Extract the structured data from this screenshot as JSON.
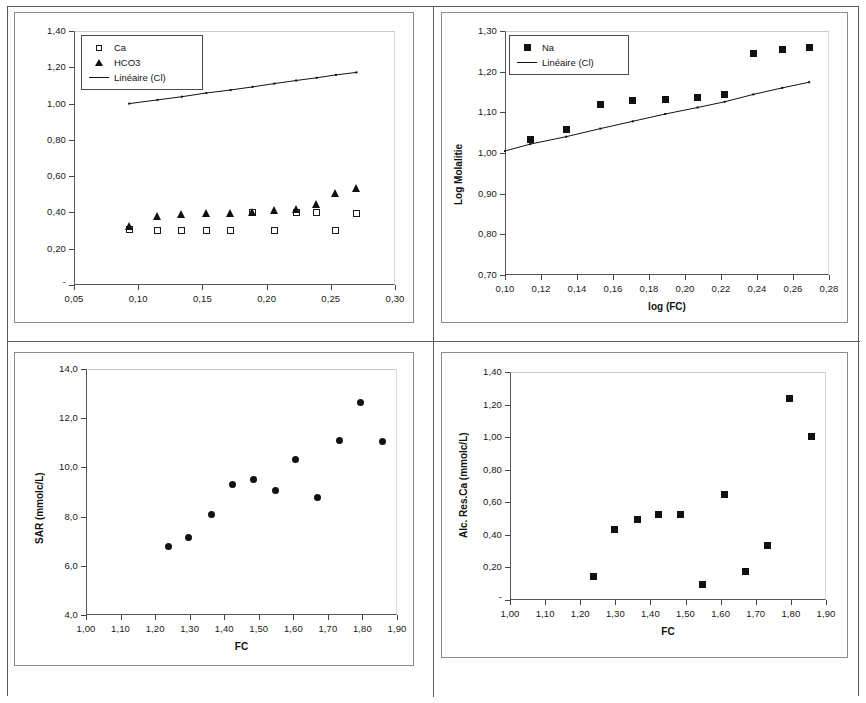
{
  "document": {
    "kind": "scanned-figure-page",
    "panel_count": 4
  },
  "charts": [
    {
      "id": "chart-1",
      "legend": [
        {
          "key": "square-open",
          "label": "Ca"
        },
        {
          "key": "triangle-filled",
          "label": "HCO3"
        },
        {
          "key": "line",
          "label": "Linéaire (Cl)"
        }
      ],
      "xticks": [
        "0,05",
        "0,10",
        "0,15",
        "0,20",
        "0,25",
        "0,30"
      ],
      "yticks": [
        "0,20",
        "0,40",
        "0,60",
        "0,80",
        "1,00",
        "1,20",
        "1,40"
      ],
      "xlabel": "",
      "ylabel": ""
    },
    {
      "id": "chart-2",
      "legend": [
        {
          "key": "square-filled",
          "label": "Na"
        },
        {
          "key": "line",
          "label": "Linéaire (Cl)"
        }
      ],
      "xticks": [
        "0,10",
        "0,12",
        "0,14",
        "0,16",
        "0,18",
        "0,20",
        "0,22",
        "0,24",
        "0,26",
        "0,28"
      ],
      "yticks": [
        "0,70",
        "0,80",
        "0,90",
        "1,00",
        "1,10",
        "1,20",
        "1,30"
      ],
      "xlabel": "log (FC)",
      "ylabel": "Log Molalitie"
    },
    {
      "id": "chart-3",
      "legend": [],
      "xticks": [
        "1,00",
        "1,10",
        "1,20",
        "1,30",
        "1,40",
        "1,50",
        "1,60",
        "1,70",
        "1,80",
        "1,90"
      ],
      "yticks": [
        "4,0",
        "6,0",
        "8,0",
        "10,0",
        "12,0",
        "14,0"
      ],
      "xlabel": "FC",
      "ylabel": "SAR (mmolc/L)"
    },
    {
      "id": "chart-4",
      "legend": [],
      "xticks": [
        "1,00",
        "1,10",
        "1,20",
        "1,30",
        "1,40",
        "1,50",
        "1,60",
        "1,70",
        "1,80",
        "1,90"
      ],
      "yticks": [
        "0,20",
        "0,40",
        "0,60",
        "0,80",
        "1,00",
        "1,20",
        "1,40"
      ],
      "xlabel": "FC",
      "ylabel": "Alc. Res.Ca (mmolc/L)"
    }
  ],
  "chart_data": [
    {
      "type": "scatter",
      "title": "",
      "xlabel": "",
      "ylabel": "",
      "xlim": [
        0.05,
        0.3
      ],
      "ylim": [
        0.0,
        1.4
      ],
      "xticks": [
        0.05,
        0.1,
        0.15,
        0.2,
        0.25,
        0.3
      ],
      "yticks": [
        0.2,
        0.4,
        0.6,
        0.8,
        1.0,
        1.2,
        1.4
      ],
      "grid": false,
      "legend_position": "top-left",
      "series": [
        {
          "name": "Ca",
          "marker": "square-open",
          "x": [
            0.093,
            0.115,
            0.134,
            0.153,
            0.172,
            0.189,
            0.206,
            0.223,
            0.239,
            0.254,
            0.27
          ],
          "y": [
            0.305,
            0.3,
            0.3,
            0.3,
            0.3,
            0.398,
            0.298,
            0.4,
            0.398,
            0.298,
            0.395
          ]
        },
        {
          "name": "HCO3",
          "marker": "triangle-filled",
          "x": [
            0.093,
            0.115,
            0.134,
            0.153,
            0.172,
            0.189,
            0.206,
            0.223,
            0.239,
            0.254,
            0.27
          ],
          "y": [
            0.325,
            0.378,
            0.39,
            0.398,
            0.395,
            0.4,
            0.415,
            0.42,
            0.447,
            0.505,
            0.537
          ]
        },
        {
          "name": "Linéaire (Cl)",
          "marker": "line",
          "x": [
            0.093,
            0.115,
            0.134,
            0.153,
            0.172,
            0.189,
            0.206,
            0.223,
            0.239,
            0.254,
            0.27
          ],
          "y": [
            1.0,
            1.02,
            1.038,
            1.058,
            1.075,
            1.092,
            1.11,
            1.127,
            1.142,
            1.158,
            1.172
          ]
        }
      ]
    },
    {
      "type": "scatter",
      "title": "",
      "xlabel": "log (FC)",
      "ylabel": "Log Molalitie",
      "xlim": [
        0.1,
        0.28
      ],
      "ylim": [
        0.7,
        1.3
      ],
      "xticks": [
        0.1,
        0.12,
        0.14,
        0.16,
        0.18,
        0.2,
        0.22,
        0.24,
        0.26,
        0.28
      ],
      "yticks": [
        0.7,
        0.8,
        0.9,
        1.0,
        1.1,
        1.2,
        1.3
      ],
      "grid": false,
      "legend_position": "top-left",
      "series": [
        {
          "name": "Na",
          "marker": "square-filled",
          "x": [
            0.114,
            0.134,
            0.153,
            0.171,
            0.189,
            0.207,
            0.222,
            0.238,
            0.254,
            0.269
          ],
          "y": [
            1.033,
            1.058,
            1.12,
            1.128,
            1.132,
            1.136,
            1.144,
            1.244,
            1.254,
            1.26
          ]
        },
        {
          "name": "Linéaire (Cl)",
          "marker": "line",
          "x": [
            0.1,
            0.114,
            0.134,
            0.153,
            0.171,
            0.189,
            0.207,
            0.222,
            0.238,
            0.254,
            0.269
          ],
          "y": [
            1.005,
            1.022,
            1.04,
            1.06,
            1.078,
            1.096,
            1.112,
            1.126,
            1.144,
            1.16,
            1.174
          ]
        }
      ]
    },
    {
      "type": "scatter",
      "title": "",
      "xlabel": "FC",
      "ylabel": "SAR (mmolc/L)",
      "xlim": [
        1.0,
        1.9
      ],
      "ylim": [
        4.0,
        14.0
      ],
      "xticks": [
        1.0,
        1.1,
        1.2,
        1.3,
        1.4,
        1.5,
        1.6,
        1.7,
        1.8,
        1.9
      ],
      "yticks": [
        4.0,
        6.0,
        8.0,
        10.0,
        12.0,
        14.0
      ],
      "grid": false,
      "legend_position": "none",
      "series": [
        {
          "name": "SAR",
          "marker": "circle-filled",
          "x": [
            1.24,
            1.297,
            1.362,
            1.424,
            1.486,
            1.549,
            1.606,
            1.669,
            1.733,
            1.795,
            1.858
          ],
          "y": [
            6.8,
            7.17,
            8.08,
            9.29,
            9.5,
            9.07,
            10.33,
            8.78,
            11.1,
            12.63,
            11.05
          ]
        }
      ]
    },
    {
      "type": "scatter",
      "title": "",
      "xlabel": "FC",
      "ylabel": "Alc. Res.Ca (mmolc/L)",
      "xlim": [
        1.0,
        1.9
      ],
      "ylim": [
        0.0,
        1.4
      ],
      "xticks": [
        1.0,
        1.1,
        1.2,
        1.3,
        1.4,
        1.5,
        1.6,
        1.7,
        1.8,
        1.9
      ],
      "yticks": [
        0.2,
        0.4,
        0.6,
        0.8,
        1.0,
        1.2,
        1.4
      ],
      "grid": false,
      "legend_position": "none",
      "series": [
        {
          "name": "Alc. Res.Ca",
          "marker": "square-filled",
          "x": [
            1.238,
            1.299,
            1.362,
            1.424,
            1.487,
            1.549,
            1.61,
            1.67,
            1.733,
            1.795,
            1.858
          ],
          "y": [
            0.145,
            0.432,
            0.497,
            0.528,
            0.528,
            0.095,
            0.65,
            0.178,
            0.335,
            1.238,
            1.003
          ]
        }
      ]
    }
  ]
}
